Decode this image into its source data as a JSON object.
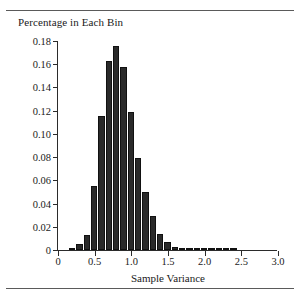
{
  "figure": {
    "title": "Percentage in Each Bin",
    "xaxis_title": "Sample Variance",
    "ink_color": "#2a2a2a",
    "rule_color": "#5a5a5a"
  },
  "chart_data": {
    "type": "bar",
    "title": "Percentage in Each Bin",
    "subtitle": "",
    "xlabel": "Sample Variance",
    "ylabel": "Percentage in Each Bin",
    "xlim": [
      0,
      3.0
    ],
    "ylim": [
      0,
      0.18
    ],
    "grid": false,
    "legend": "none",
    "bin_width": 0.1,
    "bin_starts": [
      0.15,
      0.25,
      0.35,
      0.45,
      0.55,
      0.65,
      0.75,
      0.85,
      0.95,
      1.05,
      1.15,
      1.25,
      1.35,
      1.45,
      1.55,
      1.65,
      1.75,
      1.85,
      1.95,
      2.05,
      2.15,
      2.25,
      2.35
    ],
    "bin_centers": [
      0.2,
      0.3,
      0.4,
      0.5,
      0.6,
      0.7,
      0.8,
      0.9,
      1.0,
      1.1,
      1.2,
      1.3,
      1.4,
      1.5,
      1.6,
      1.7,
      1.8,
      1.9,
      2.0,
      2.1,
      2.2,
      2.3,
      2.4
    ],
    "values": [
      0.001,
      0.005,
      0.013,
      0.055,
      0.115,
      0.163,
      0.176,
      0.158,
      0.119,
      0.079,
      0.05,
      0.029,
      0.014,
      0.007,
      0.003,
      0.0015,
      0.001,
      0.0005,
      0.0003,
      0.0002,
      0.0001,
      0.0001,
      0.0001
    ],
    "xticks": [
      0,
      0.5,
      1.0,
      1.5,
      2.0,
      2.5,
      3.0
    ],
    "xticklabels": [
      "0",
      "0.5",
      "1.0",
      "1.5",
      "2.0",
      "2.5",
      "3.0"
    ],
    "yticks": [
      0,
      0.02,
      0.04,
      0.06,
      0.08,
      0.1,
      0.12,
      0.14,
      0.16,
      0.18
    ],
    "yticklabels": [
      "0",
      "0.02",
      "0.04",
      "0.06",
      "0.08",
      "0.10",
      "0.12",
      "0.14",
      "0.16",
      "0.18"
    ]
  }
}
